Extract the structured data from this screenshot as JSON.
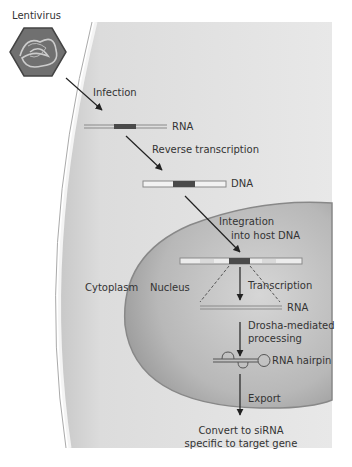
{
  "labels": {
    "lentivirus": "Lentivirus",
    "infection": "Infection",
    "rna1": "RNA",
    "reverse_transcription": "Reverse transcription",
    "dna": "DNA",
    "integration_line1": "Integration",
    "integration_line2": "into host DNA",
    "cytoplasm": "Cytoplasm",
    "nucleus": "Nucleus",
    "transcription": "Transcription",
    "rna2": "RNA",
    "drosha_line1": "Drosha-mediated",
    "drosha_line2": "processing",
    "rna_hairpin": "RNA hairpin",
    "export": "Export",
    "convert_line1": "Convert to siRNA",
    "convert_line2": "specific to target gene"
  },
  "colors": {
    "cell_fill": "#d9d9d9",
    "nucleus_fill": "#bdbdbd",
    "strand": "#8a8a8a",
    "insert": "#4a4a4a",
    "text": "#333333"
  }
}
